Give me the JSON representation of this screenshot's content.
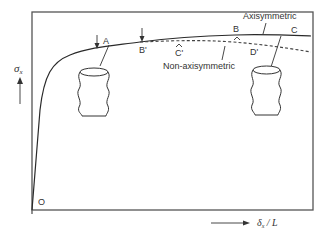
{
  "figure": {
    "y_axis_label": "σ",
    "y_axis_subscript": "x",
    "x_axis_label_delta": "δ",
    "x_axis_subscript": "x",
    "x_axis_label_rest": " / L",
    "origin_label": "O"
  },
  "points": {
    "A": "A",
    "B_prime": "B'",
    "C_prime": "C'",
    "B": "B",
    "D_prime": "D'",
    "C": "C"
  },
  "annotations": {
    "axisymmetric": "Axisymmetric",
    "non_axisymmetric": "Non-axisymmetric"
  },
  "colors": {
    "line": "#2a2a2a",
    "frame": "#555555",
    "background": "#ffffff"
  }
}
